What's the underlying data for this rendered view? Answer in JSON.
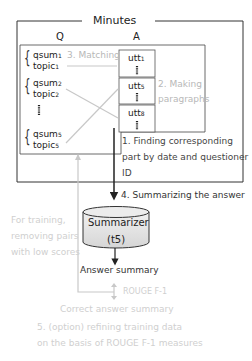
{
  "title": "Minutes",
  "columns": {
    "q": "Q",
    "a": "A"
  },
  "questions": [
    {
      "qsum": "qsum",
      "qsum_sub": "1",
      "topic": "topic",
      "topic_sub": "1"
    },
    {
      "qsum": "qsum",
      "qsum_sub": "2",
      "topic": "topic",
      "topic_sub": "2"
    },
    {
      "qsum": "qsum",
      "qsum_sub": "5",
      "topic": "topic",
      "topic_sub": "5"
    }
  ],
  "utterances": [
    {
      "label": "utt",
      "sub": "1"
    },
    {
      "label": "utt",
      "sub": "5"
    },
    {
      "label": "utt",
      "sub": "8"
    }
  ],
  "steps": {
    "matching": "3. Matching",
    "making_paragraphs_1": "2. Making",
    "making_paragraphs_2": "paragraphs",
    "finding_1": "1. Finding corresponding",
    "finding_2": "part by date and questioner",
    "finding_3": "ID",
    "summarizing": "4. Summarizing the answer"
  },
  "summarizer": {
    "name": "Summarizer",
    "model": "(t5)"
  },
  "answer_summary": "Answer summary",
  "rouge": "ROUGE F-1",
  "correct_summary": "Correct answer summary",
  "training_note": [
    "For training,",
    "removing pairs",
    "with low scores"
  ],
  "refining": [
    "5. (option) refining training data",
    "on the basis of ROUGE F-1 measures"
  ],
  "colors": {
    "line": "#222222",
    "faded": "#c8c8c8",
    "cylinder": "#e2e2e2"
  }
}
